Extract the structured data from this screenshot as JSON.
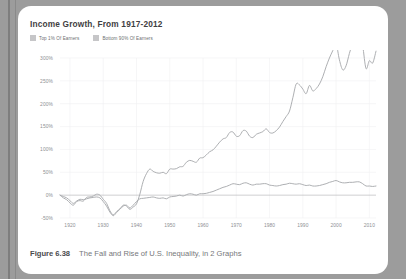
{
  "page": {
    "background_color": "#9c9c9c",
    "card_background": "#ffffff"
  },
  "chart": {
    "title": "Income Growth, From 1917-2012",
    "legend": [
      {
        "label": "Top 1% Of Earners",
        "swatch_color": "#c6c6c8",
        "line_color": "#a9abae"
      },
      {
        "label": "Bottom 90% Of Earners",
        "swatch_color": "#c6c6c8",
        "line_color": "#a9abae"
      }
    ]
  },
  "caption": {
    "label": "Figure 6.38",
    "text": "The Fall and Rise of U.S. Inequality, in 2 Graphs"
  },
  "chart_data": {
    "type": "line",
    "title": "Income Growth, From 1917-2012",
    "xlabel": "",
    "ylabel": "",
    "xlim": [
      1917,
      2012
    ],
    "ylim": [
      -50,
      300
    ],
    "yticks": [
      -50,
      0,
      50,
      100,
      150,
      200,
      250,
      300
    ],
    "ytick_labels": [
      "-50%",
      "0%",
      "50%",
      "100%",
      "150%",
      "200%",
      "250%",
      "300%"
    ],
    "xticks": [
      1920,
      1930,
      1940,
      1950,
      1960,
      1970,
      1980,
      1990,
      2000,
      2010
    ],
    "xtick_labels": [
      "1920",
      "1930",
      "1940",
      "1950",
      "1960",
      "1970",
      "1980",
      "1990",
      "2000",
      "2010"
    ],
    "grid": true,
    "legend_position": "top-left",
    "x": [
      1917,
      1918,
      1919,
      1920,
      1921,
      1922,
      1923,
      1924,
      1925,
      1926,
      1927,
      1928,
      1929,
      1930,
      1931,
      1932,
      1933,
      1934,
      1935,
      1936,
      1937,
      1938,
      1939,
      1940,
      1941,
      1942,
      1943,
      1944,
      1945,
      1946,
      1947,
      1948,
      1949,
      1950,
      1951,
      1952,
      1953,
      1954,
      1955,
      1956,
      1957,
      1958,
      1959,
      1960,
      1961,
      1962,
      1963,
      1964,
      1965,
      1966,
      1967,
      1968,
      1969,
      1970,
      1971,
      1972,
      1973,
      1974,
      1975,
      1976,
      1977,
      1978,
      1979,
      1980,
      1981,
      1982,
      1983,
      1984,
      1985,
      1986,
      1987,
      1988,
      1989,
      1990,
      1991,
      1992,
      1993,
      1994,
      1995,
      1996,
      1997,
      1998,
      1999,
      2000,
      2001,
      2002,
      2003,
      2004,
      2005,
      2006,
      2007,
      2008,
      2009,
      2010,
      2011,
      2012
    ],
    "series": [
      {
        "name": "Top 1% Of Earners",
        "color": "#a9abae",
        "values": [
          0,
          -6,
          -10,
          -17,
          -22,
          -14,
          -12,
          -13,
          -5,
          -4,
          -2,
          2,
          0,
          -9,
          -18,
          -34,
          -43,
          -36,
          -30,
          -22,
          -24,
          -31,
          -26,
          -19,
          2,
          30,
          47,
          57,
          52,
          49,
          48,
          50,
          47,
          57,
          57,
          58,
          62,
          63,
          72,
          76,
          74,
          72,
          81,
          82,
          88,
          95,
          99,
          107,
          116,
          123,
          126,
          137,
          138,
          129,
          130,
          141,
          140,
          129,
          126,
          133,
          136,
          139,
          145,
          137,
          136,
          141,
          149,
          161,
          172,
          184,
          213,
          243,
          241,
          232,
          222,
          240,
          228,
          233,
          243,
          259,
          281,
          300,
          316,
          331,
          296,
          274,
          283,
          310,
          334,
          357,
          361,
          327,
          277,
          294,
          289,
          315
        ]
      },
      {
        "name": "Bottom 90% Of Earners",
        "color": "#a9abae",
        "values": [
          0,
          -3,
          -6,
          -12,
          -18,
          -13,
          -9,
          -10,
          -8,
          -6,
          -5,
          -4,
          -6,
          -14,
          -24,
          -37,
          -45,
          -38,
          -31,
          -24,
          -22,
          -28,
          -22,
          -14,
          -8,
          -7,
          -6,
          -5,
          -4,
          -6,
          -7,
          -6,
          -8,
          -4,
          -3,
          -2,
          0,
          -2,
          1,
          3,
          2,
          0,
          3,
          3,
          4,
          6,
          8,
          11,
          14,
          17,
          19,
          22,
          25,
          24,
          23,
          26,
          27,
          24,
          22,
          24,
          24,
          25,
          25,
          22,
          21,
          20,
          21,
          23,
          24,
          26,
          25,
          24,
          25,
          23,
          21,
          22,
          20,
          20,
          21,
          23,
          25,
          28,
          30,
          32,
          29,
          27,
          27,
          28,
          28,
          29,
          29,
          25,
          20,
          20,
          19,
          20
        ]
      }
    ]
  }
}
